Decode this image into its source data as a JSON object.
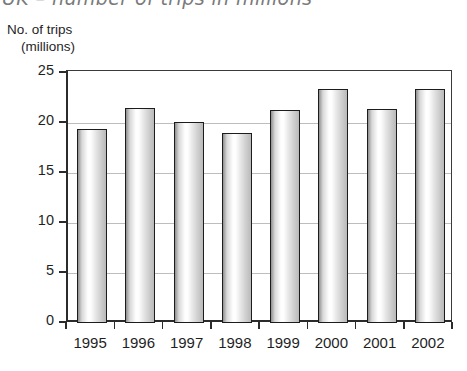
{
  "top_caption": "UK – number of trips in millions",
  "axis_title": {
    "line1": "No. of trips",
    "line2": "(millions)"
  },
  "colors": {
    "axis": "#2b2b2b",
    "gridline": "#bdbdbd",
    "bar_border": "#1c1c1c",
    "text": "#1f1f1f",
    "caption": "#7a7a7a"
  },
  "chart_data": {
    "type": "bar",
    "title": "UK – number of trips in millions",
    "xlabel": "",
    "ylabel": "No. of trips (millions)",
    "categories": [
      "1995",
      "1996",
      "1997",
      "1998",
      "1999",
      "2000",
      "2001",
      "2002"
    ],
    "values": [
      19.4,
      21.5,
      20.1,
      19.0,
      21.3,
      23.4,
      21.4,
      23.4
    ],
    "ylim": [
      0,
      25
    ],
    "yticks": [
      0,
      5,
      10,
      15,
      20,
      25
    ],
    "ytick_labels": [
      "0",
      "5",
      "10",
      "15",
      "20",
      "25"
    ],
    "grid": true,
    "legend": null
  }
}
